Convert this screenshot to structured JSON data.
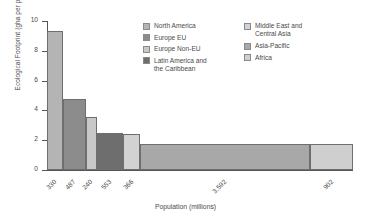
{
  "chart_data": {
    "type": "bar",
    "title": "",
    "subtitle": "",
    "xlabel": "Population (millions)",
    "ylabel": "Ecological Footprint (gha per person)",
    "variable_width": true,
    "width_meaning": "Bar width is proportional to population (millions); bar height is Ecological Footprint in gha per person.",
    "grid": false,
    "ylim": [
      0,
      10
    ],
    "ytick_labels": [
      "0",
      "2",
      "4",
      "6",
      "8",
      "10"
    ],
    "ytick_values": [
      0,
      2,
      4,
      6,
      8,
      10
    ],
    "xtick_labels": [
      "330",
      "487",
      "240",
      "553",
      "366",
      "3,592",
      "902"
    ],
    "categories": [
      "North America",
      "Europe EU",
      "Europe Non-EU",
      "Latin America and the Caribbean",
      "Middle East and Central Asia",
      "Asia-Pacific",
      "Africa"
    ],
    "values": [
      9.3,
      4.75,
      3.55,
      2.5,
      2.4,
      1.75,
      1.75
    ],
    "widths": [
      330,
      487,
      240,
      553,
      366,
      3592,
      902
    ],
    "colors": [
      "#b4b4b4",
      "#8c8c8c",
      "#c8c8c8",
      "#6e6e6e",
      "#d2d2d2",
      "#a8a8a8",
      "#cfcfcf"
    ],
    "legend_position": "top-right",
    "series": [
      {
        "name": "Ecological Footprint (gha per person)",
        "values": [
          9.3,
          4.75,
          3.55,
          2.5,
          2.4,
          1.75,
          1.75
        ]
      }
    ]
  },
  "legend": {
    "left_column": [
      {
        "label": "North America",
        "color": "#b4b4b4"
      },
      {
        "label": "Europe EU",
        "color": "#8c8c8c"
      },
      {
        "label": "Europe Non-EU",
        "color": "#c8c8c8"
      },
      {
        "label": "Latin America and\nthe Caribbean",
        "color": "#6e6e6e"
      }
    ],
    "right_column": [
      {
        "label": "Middle East and\nCentral Asia",
        "color": "#d2d2d2"
      },
      {
        "label": "Asia-Pacific",
        "color": "#a8a8a8"
      },
      {
        "label": "Africa",
        "color": "#cfcfcf"
      }
    ]
  }
}
